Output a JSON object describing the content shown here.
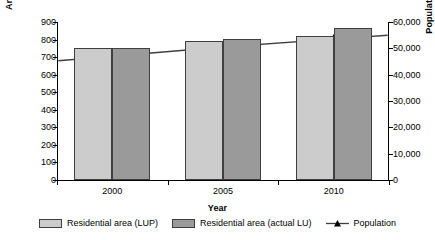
{
  "chart_data": {
    "type": "bar",
    "title": "",
    "categories": [
      "2000",
      "2005",
      "2010"
    ],
    "xlabel": "Year",
    "ylabel": "Area (ha)",
    "y2label": "Population (Person)",
    "ylim": [
      0,
      900
    ],
    "y2lim": [
      0,
      60000
    ],
    "yticks": [
      "0",
      "100",
      "200",
      "300",
      "400",
      "500",
      "600",
      "700",
      "800",
      "900"
    ],
    "ytick_values": [
      0,
      100,
      200,
      300,
      400,
      500,
      600,
      700,
      800,
      900
    ],
    "y2ticks": [
      "0",
      "10,000",
      "20,000",
      "30,000",
      "40,000",
      "50,000",
      "60,000"
    ],
    "y2tick_values": [
      0,
      10000,
      20000,
      30000,
      40000,
      50000,
      60000
    ],
    "grid": false,
    "legend_position": "bottom",
    "series": [
      {
        "name": "Residential area (LUP)",
        "kind": "bar",
        "axis": "left",
        "color": "#cccccc",
        "values": [
          750,
          790,
          822
        ]
      },
      {
        "name": "Residential area (actual LU)",
        "kind": "bar",
        "axis": "left",
        "color": "#9a9a9a",
        "values": [
          750,
          802,
          865
        ]
      },
      {
        "name": "Population",
        "kind": "line",
        "axis": "right",
        "color": "#3f3f3f",
        "marker": "triangle",
        "values": [
          47000,
          50500,
          53500
        ]
      }
    ]
  },
  "legend": {
    "items": [
      {
        "label": "Residential area (LUP)",
        "swatch": "light-gray-swatch"
      },
      {
        "label": "Residential area (actual LU)",
        "swatch": "dark-gray-swatch"
      },
      {
        "label": "Population",
        "swatch": "line-triangle-marker"
      }
    ]
  }
}
